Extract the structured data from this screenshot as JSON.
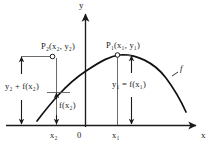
{
  "figure": {
    "background_color": "#ffffff",
    "ink_color": "#1a1a1a",
    "curve_color": "#111111",
    "guide_color": "#5a5a5a"
  },
  "axes": {
    "x_label": "x",
    "y_label": "y",
    "origin_label": "0",
    "ticks": [
      {
        "name": "x2-tick",
        "label": "x₂",
        "x": 56
      },
      {
        "name": "x1-tick",
        "label": "x₁",
        "x": 118
      }
    ]
  },
  "points": [
    {
      "name": "point-p2",
      "label": "P₂(x₂, y₂)",
      "label_main": "P",
      "label_sub": "2",
      "label_rest": "(x₂, y₂)",
      "x": 52,
      "y": 56
    },
    {
      "name": "point-p1",
      "label": "P₁(x₁, y₁)",
      "label_main": "P",
      "label_sub": "1",
      "label_rest": "(x₁, y₁)",
      "x": 117,
      "y": 55
    }
  ],
  "measurements": [
    {
      "name": "measure-y2-plus-fx2",
      "label": "y₂ + f(x₂)",
      "from_y": 56,
      "to_y": 125,
      "at_x": 21
    },
    {
      "name": "measure-fx2",
      "label": "f(x₂)",
      "from_y": 92,
      "to_y": 125,
      "at_x": 56
    },
    {
      "name": "measure-y1-equals-fx1",
      "label": "y₁ = f(x₁)",
      "from_y": 55,
      "to_y": 125,
      "at_x": 131
    }
  ],
  "curve": {
    "name": "function-curve",
    "label": "f",
    "label_x": 181,
    "label_y": 70
  }
}
